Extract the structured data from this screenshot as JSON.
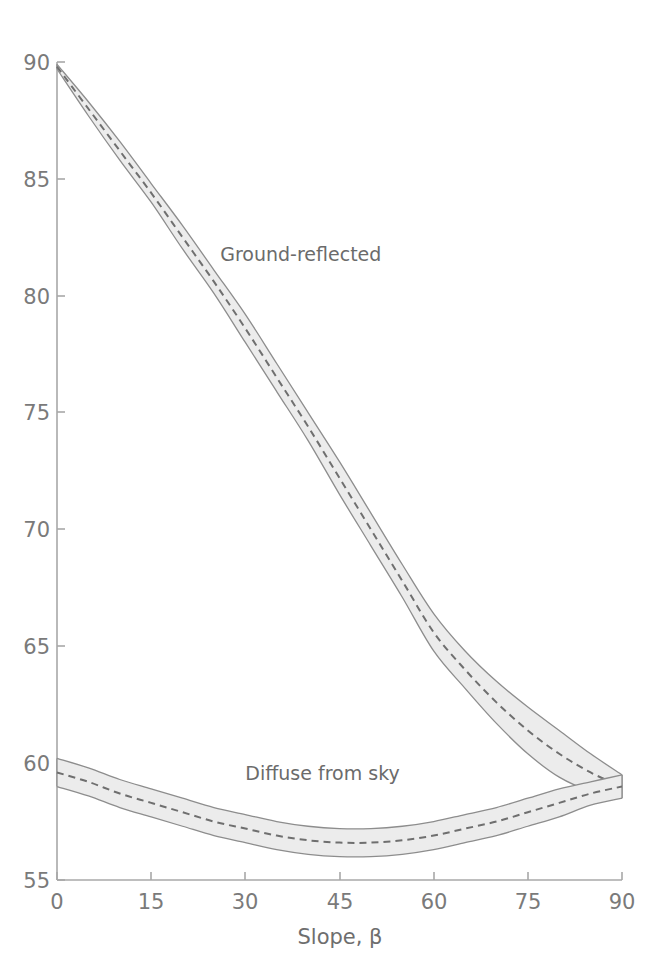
{
  "figure": {
    "title": "Effective incidence angle, θ",
    "background_color": "#ffffff"
  },
  "axes": {
    "x_axis_label": "Slope, β",
    "y_axis_label": "Effective incidence angle, θ",
    "x_ticks": [
      "0",
      "15",
      "30",
      "45",
      "60",
      "75",
      "90"
    ],
    "y_ticks": [
      "55",
      "60",
      "65",
      "70",
      "75",
      "80",
      "85",
      "90"
    ],
    "axis_color": "#9a9a9a",
    "tick_label_color": "#7a7a7a"
  },
  "annotations": {
    "ground_label": "Ground-reflected",
    "diffuse_label": "Diffuse from sky"
  },
  "style": {
    "band_fill": "#ececec",
    "band_edge": "#8d8d8d",
    "center_line": "#6f6f6f"
  },
  "chart_data": {
    "type": "line",
    "title": "Effective incidence angle, θ",
    "xlabel": "Slope, β",
    "ylabel": "Effective incidence angle, θ",
    "xlim": [
      0,
      90
    ],
    "ylim": [
      55,
      90
    ],
    "x_ticks": [
      0,
      15,
      30,
      45,
      60,
      75,
      90
    ],
    "y_ticks": [
      55,
      60,
      65,
      70,
      75,
      80,
      85,
      90
    ],
    "grid": false,
    "legend": "inline-annotations",
    "x": [
      0,
      5,
      10,
      15,
      20,
      25,
      30,
      35,
      40,
      45,
      50,
      55,
      60,
      65,
      70,
      75,
      80,
      85,
      90
    ],
    "series": [
      {
        "name": "Ground-reflected",
        "style": "dashed-center-with-uncertainty-band",
        "values": [
          89.8,
          88.0,
          86.2,
          84.4,
          82.5,
          80.6,
          78.6,
          76.5,
          74.4,
          72.2,
          70.0,
          67.8,
          65.6,
          64.0,
          62.6,
          61.4,
          60.4,
          59.6,
          59.0
        ],
        "band_upper": [
          89.9,
          88.3,
          86.6,
          84.8,
          83.0,
          81.1,
          79.2,
          77.1,
          75.0,
          72.9,
          70.7,
          68.5,
          66.4,
          64.8,
          63.5,
          62.4,
          61.4,
          60.4,
          59.5
        ],
        "band_lower": [
          89.7,
          87.7,
          85.8,
          84.0,
          82.0,
          80.1,
          78.0,
          75.9,
          73.8,
          71.5,
          69.3,
          67.1,
          64.8,
          63.2,
          61.7,
          60.4,
          59.4,
          58.8,
          58.5
        ]
      },
      {
        "name": "Diffuse from sky",
        "style": "dashed-center-with-uncertainty-band",
        "values": [
          59.6,
          59.2,
          58.7,
          58.3,
          57.9,
          57.5,
          57.2,
          56.9,
          56.7,
          56.6,
          56.6,
          56.7,
          56.9,
          57.2,
          57.5,
          57.9,
          58.3,
          58.7,
          59.0
        ],
        "band_upper": [
          60.2,
          59.8,
          59.3,
          58.9,
          58.5,
          58.1,
          57.8,
          57.5,
          57.3,
          57.2,
          57.2,
          57.3,
          57.5,
          57.8,
          58.1,
          58.5,
          58.9,
          59.2,
          59.5
        ],
        "band_lower": [
          59.0,
          58.6,
          58.1,
          57.7,
          57.3,
          56.9,
          56.6,
          56.3,
          56.1,
          56.0,
          56.0,
          56.1,
          56.3,
          56.6,
          56.9,
          57.3,
          57.7,
          58.2,
          58.5
        ]
      }
    ],
    "annotations": [
      {
        "text": "Ground-reflected",
        "x": 26,
        "y": 81.5
      },
      {
        "text": "Diffuse from sky",
        "x": 30,
        "y": 59.3
      }
    ]
  }
}
